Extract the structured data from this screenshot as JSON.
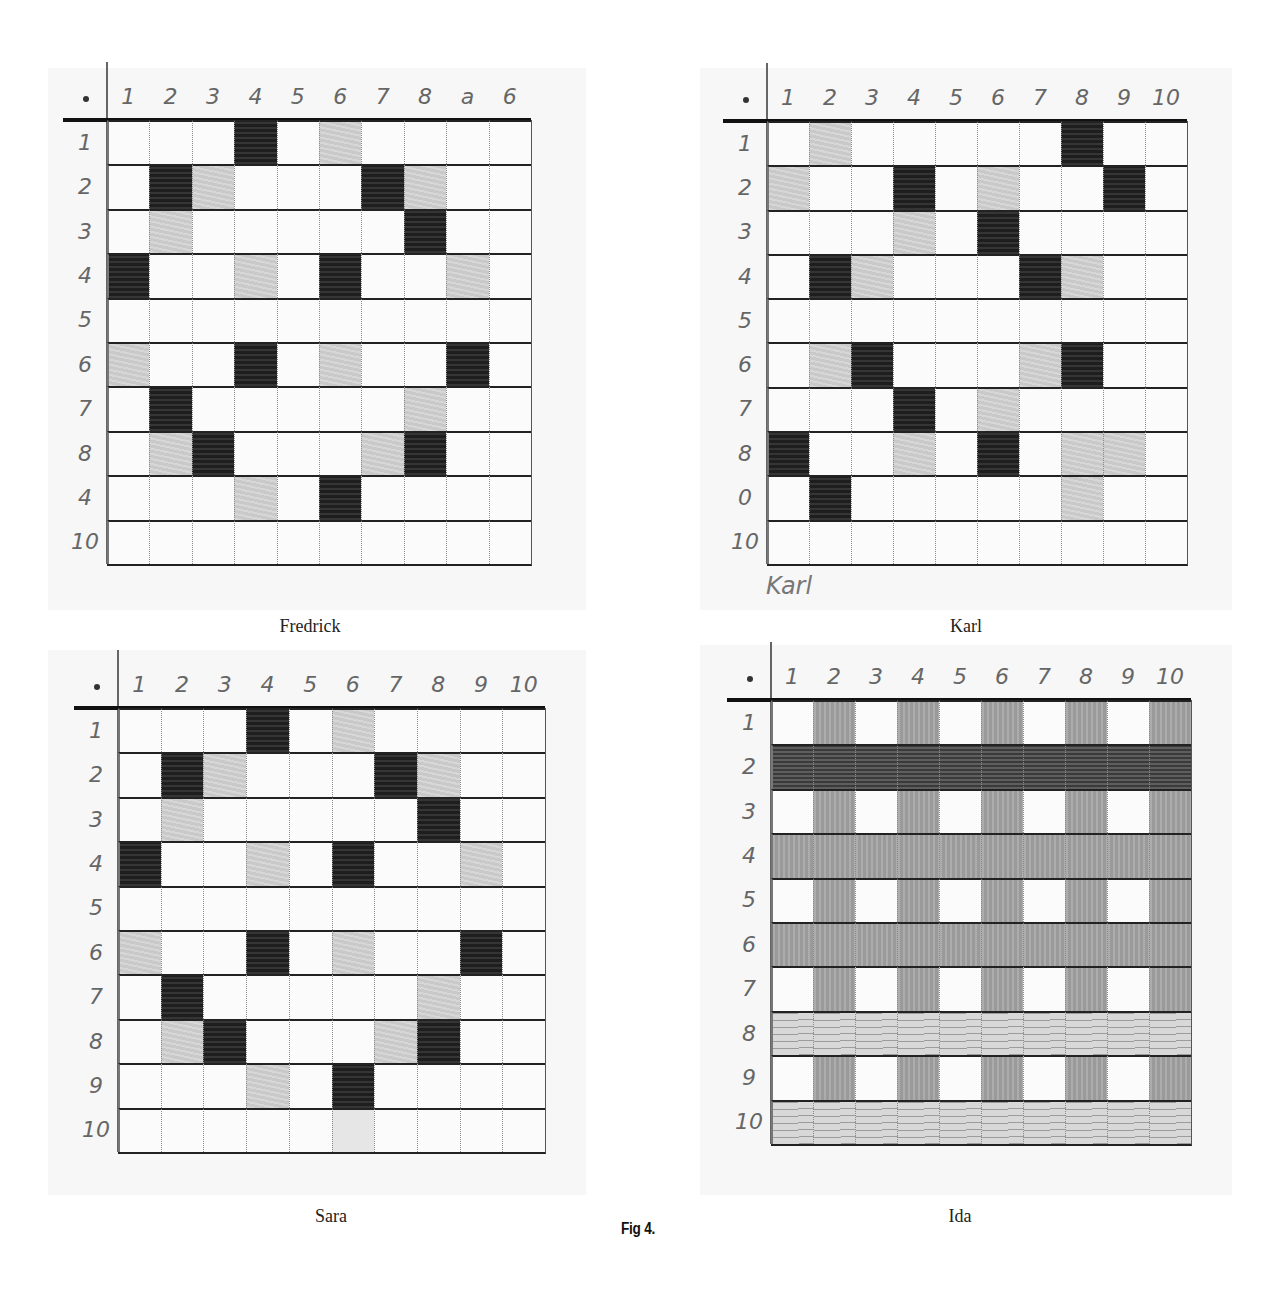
{
  "figure": {
    "caption": "Fig 4."
  },
  "chart_data": [
    {
      "type": "heatmap",
      "title": "Fredrick",
      "xlabel": "",
      "ylabel": "",
      "col_labels": [
        "1",
        "2",
        "3",
        "4",
        "5",
        "6",
        "7",
        "8",
        "9",
        "10"
      ],
      "col_labels_as_written": [
        "1",
        "2",
        "3",
        "4",
        "5",
        "6",
        "7",
        "8",
        "a",
        "6"
      ],
      "row_labels": [
        "1",
        "2",
        "3",
        "4",
        "5",
        "6",
        "7",
        "8",
        "9",
        "10"
      ],
      "row_labels_as_written": [
        "1",
        "2",
        "3",
        "4",
        "5",
        "6",
        "7",
        "8",
        "4",
        "10"
      ],
      "legend": {
        "0": "white",
        "1": "light shading",
        "2": "dark shading"
      },
      "cells": [
        [
          0,
          0,
          0,
          2,
          0,
          1,
          0,
          0,
          0,
          0
        ],
        [
          0,
          2,
          1,
          0,
          0,
          0,
          2,
          1,
          0,
          0
        ],
        [
          0,
          1,
          0,
          0,
          0,
          0,
          0,
          2,
          0,
          0
        ],
        [
          2,
          0,
          0,
          1,
          0,
          2,
          0,
          0,
          1,
          0
        ],
        [
          0,
          0,
          0,
          0,
          0,
          0,
          0,
          0,
          0,
          0
        ],
        [
          1,
          0,
          0,
          2,
          0,
          1,
          0,
          0,
          2,
          0
        ],
        [
          0,
          2,
          0,
          0,
          0,
          0,
          0,
          1,
          0,
          0
        ],
        [
          0,
          1,
          2,
          0,
          0,
          0,
          1,
          2,
          0,
          0
        ],
        [
          0,
          0,
          0,
          1,
          0,
          2,
          0,
          0,
          0,
          0
        ],
        [
          0,
          0,
          0,
          0,
          0,
          0,
          0,
          0,
          0,
          0
        ]
      ]
    },
    {
      "type": "heatmap",
      "title": "Karl",
      "handwritten_name": "Karl",
      "xlabel": "",
      "ylabel": "",
      "col_labels": [
        "1",
        "2",
        "3",
        "4",
        "5",
        "6",
        "7",
        "8",
        "9",
        "10"
      ],
      "row_labels": [
        "1",
        "2",
        "3",
        "4",
        "5",
        "6",
        "7",
        "8",
        "9",
        "10"
      ],
      "row_labels_as_written": [
        "1",
        "2",
        "3",
        "4",
        "5",
        "6",
        "7",
        "8",
        "0",
        "10"
      ],
      "legend": {
        "0": "white",
        "1": "light shading",
        "2": "dark shading"
      },
      "cells": [
        [
          0,
          1,
          0,
          0,
          0,
          0,
          0,
          2,
          0,
          0
        ],
        [
          1,
          0,
          0,
          2,
          0,
          1,
          0,
          0,
          2,
          0
        ],
        [
          0,
          0,
          0,
          1,
          0,
          2,
          0,
          0,
          0,
          0
        ],
        [
          0,
          2,
          1,
          0,
          0,
          0,
          2,
          1,
          0,
          0
        ],
        [
          0,
          0,
          0,
          0,
          0,
          0,
          0,
          0,
          0,
          0
        ],
        [
          0,
          1,
          2,
          0,
          0,
          0,
          1,
          2,
          0,
          0
        ],
        [
          0,
          0,
          0,
          2,
          0,
          1,
          0,
          0,
          0,
          0
        ],
        [
          2,
          0,
          0,
          1,
          0,
          2,
          0,
          1,
          1,
          0
        ],
        [
          0,
          2,
          0,
          0,
          0,
          0,
          0,
          1,
          0,
          0
        ],
        [
          0,
          0,
          0,
          0,
          0,
          0,
          0,
          0,
          0,
          0
        ]
      ]
    },
    {
      "type": "heatmap",
      "title": "Sara",
      "xlabel": "",
      "ylabel": "",
      "col_labels": [
        "1",
        "2",
        "3",
        "4",
        "5",
        "6",
        "7",
        "8",
        "9",
        "10"
      ],
      "row_labels": [
        "1",
        "2",
        "3",
        "4",
        "5",
        "6",
        "7",
        "8",
        "9",
        "10"
      ],
      "legend": {
        "0": "white",
        "1": "light shading",
        "2": "dark shading",
        "3": "very faint"
      },
      "cells": [
        [
          0,
          0,
          0,
          2,
          0,
          1,
          0,
          0,
          0,
          0
        ],
        [
          0,
          2,
          1,
          0,
          0,
          0,
          2,
          1,
          0,
          0
        ],
        [
          0,
          1,
          0,
          0,
          0,
          0,
          0,
          2,
          0,
          0
        ],
        [
          2,
          0,
          0,
          1,
          0,
          2,
          0,
          0,
          1,
          0
        ],
        [
          0,
          0,
          0,
          0,
          0,
          0,
          0,
          0,
          0,
          0
        ],
        [
          1,
          0,
          0,
          2,
          0,
          1,
          0,
          0,
          2,
          0
        ],
        [
          0,
          2,
          0,
          0,
          0,
          0,
          0,
          1,
          0,
          0
        ],
        [
          0,
          1,
          2,
          0,
          0,
          0,
          1,
          2,
          0,
          0
        ],
        [
          0,
          0,
          0,
          1,
          0,
          2,
          0,
          0,
          0,
          0
        ],
        [
          0,
          0,
          0,
          0,
          0,
          3,
          0,
          0,
          0,
          0
        ]
      ]
    },
    {
      "type": "heatmap",
      "title": "Ida",
      "xlabel": "",
      "ylabel": "",
      "col_labels": [
        "1",
        "2",
        "3",
        "4",
        "5",
        "6",
        "7",
        "8",
        "9",
        "10"
      ],
      "row_labels": [
        "1",
        "2",
        "3",
        "4",
        "5",
        "6",
        "7",
        "8",
        "9",
        "10"
      ],
      "legend": {
        "0": "white",
        "1": "medium vertical shading",
        "2": "heavy horizontal shading (full row)",
        "3": "medium full-row shading",
        "4": "light horizontal streaks (full row)"
      },
      "cells": [
        [
          0,
          1,
          0,
          1,
          0,
          1,
          0,
          1,
          0,
          1
        ],
        [
          2,
          2,
          2,
          2,
          2,
          2,
          2,
          2,
          2,
          2
        ],
        [
          0,
          1,
          0,
          1,
          0,
          1,
          0,
          1,
          0,
          1
        ],
        [
          3,
          3,
          3,
          3,
          3,
          3,
          3,
          3,
          3,
          3
        ],
        [
          0,
          1,
          0,
          1,
          0,
          1,
          0,
          1,
          0,
          1
        ],
        [
          3,
          3,
          3,
          3,
          3,
          3,
          3,
          3,
          3,
          3
        ],
        [
          0,
          1,
          0,
          1,
          0,
          1,
          0,
          1,
          0,
          1
        ],
        [
          4,
          4,
          4,
          4,
          4,
          4,
          4,
          4,
          4,
          4
        ],
        [
          0,
          1,
          0,
          1,
          0,
          1,
          0,
          1,
          0,
          1
        ],
        [
          4,
          4,
          4,
          4,
          4,
          4,
          4,
          4,
          4,
          4
        ]
      ]
    }
  ]
}
